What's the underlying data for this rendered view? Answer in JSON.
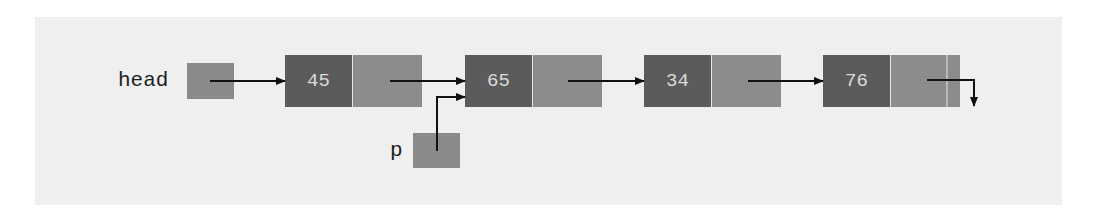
{
  "diagram": {
    "type": "linked-list",
    "colors": {
      "panel_bg": "#efefef",
      "data_cell": "#5b5b5b",
      "next_cell": "#8c8c8c",
      "pointer_cell": "#8a8a8a",
      "value_text": "#dcdcdc",
      "arrow": "#111111",
      "label_text": "#1e1e1e"
    },
    "pointers": {
      "head": {
        "label": "head",
        "points_to": 0
      },
      "p": {
        "label": "p",
        "points_to": 1
      }
    },
    "nodes": [
      {
        "value": "45",
        "next": 1
      },
      {
        "value": "65",
        "next": 2
      },
      {
        "value": "34",
        "next": 3
      },
      {
        "value": "76",
        "next": "null"
      }
    ]
  }
}
